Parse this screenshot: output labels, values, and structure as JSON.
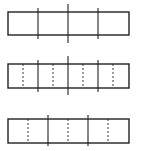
{
  "diagram": {
    "type": "fraction-strips",
    "stroke_color": "#222222",
    "background": "#ffffff",
    "strips": [
      {
        "name": "strip-quarters",
        "x": 8,
        "y": 12,
        "width": 121,
        "height": 23,
        "solid_lines": [
          {
            "x": 38,
            "y1": 8,
            "y2": 39
          },
          {
            "x": 68,
            "y1": 4,
            "y2": 43
          },
          {
            "x": 98,
            "y1": 8,
            "y2": 39
          }
        ],
        "dashed_lines": []
      },
      {
        "name": "strip-eighths",
        "x": 8,
        "y": 64,
        "width": 121,
        "height": 24,
        "solid_lines": [
          {
            "x": 38,
            "y1": 60,
            "y2": 92
          },
          {
            "x": 68,
            "y1": 56,
            "y2": 95
          },
          {
            "x": 98,
            "y1": 60,
            "y2": 92
          }
        ],
        "dashed_lines": [
          {
            "x": 23,
            "y1": 64,
            "y2": 88
          },
          {
            "x": 53,
            "y1": 64,
            "y2": 88
          },
          {
            "x": 83,
            "y1": 64,
            "y2": 88
          },
          {
            "x": 113,
            "y1": 64,
            "y2": 88
          }
        ]
      },
      {
        "name": "strip-sixths",
        "x": 8,
        "y": 119,
        "width": 121,
        "height": 24,
        "solid_lines": [
          {
            "x": 48,
            "y1": 115,
            "y2": 146
          },
          {
            "x": 88,
            "y1": 115,
            "y2": 146
          }
        ],
        "dashed_lines": [
          {
            "x": 28,
            "y1": 119,
            "y2": 143
          },
          {
            "x": 68,
            "y1": 119,
            "y2": 143
          },
          {
            "x": 108,
            "y1": 119,
            "y2": 143
          }
        ]
      }
    ]
  }
}
